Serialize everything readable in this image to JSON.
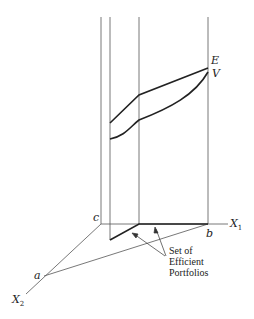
{
  "diagram": {
    "labels": {
      "E": "E",
      "V": "V",
      "c": "c",
      "b": "b",
      "a": "a",
      "X1": "X",
      "X1_sub": "1",
      "X2": "X",
      "X2_sub": "2"
    },
    "annotation": [
      "Set of",
      "Efficient",
      "Portfolios"
    ]
  }
}
